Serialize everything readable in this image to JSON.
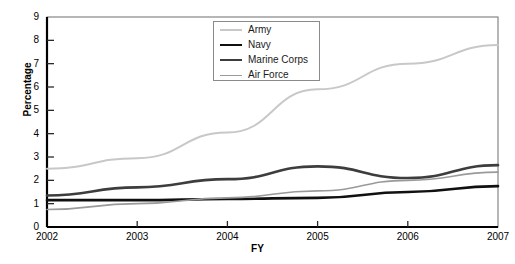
{
  "chart_data": {
    "type": "line",
    "title": "",
    "xlabel": "FY",
    "ylabel": "Percentage",
    "categories": [
      "2002",
      "2003",
      "2004",
      "2005",
      "2006",
      "2007"
    ],
    "x": [
      2002,
      2003,
      2004,
      2005,
      2006,
      2007
    ],
    "xlim": [
      2002,
      2007
    ],
    "ylim": [
      0,
      9
    ],
    "yticks": [
      0,
      1,
      2,
      3,
      4,
      5,
      6,
      7,
      8,
      9
    ],
    "ytick_labels": [
      "0",
      "1",
      "2",
      "3",
      "4",
      "5",
      "6",
      "7",
      "8",
      "9"
    ],
    "xtick_labels": [
      "2002",
      "2003",
      "2004",
      "2005",
      "2006",
      "2007"
    ],
    "grid": false,
    "legend_position": "upper-center-right",
    "series": [
      {
        "name": "Army",
        "values": [
          2.5,
          2.95,
          4.05,
          5.9,
          7.0,
          7.8
        ],
        "color": "#c8c8c8",
        "width": 2
      },
      {
        "name": "Navy",
        "values": [
          1.15,
          1.15,
          1.2,
          1.25,
          1.5,
          1.75
        ],
        "color": "#101010",
        "width": 2.6
      },
      {
        "name": "Marine Corps",
        "values": [
          1.35,
          1.7,
          2.05,
          2.6,
          2.1,
          2.65
        ],
        "color": "#3d3d3d",
        "width": 2.6
      },
      {
        "name": "Air Force",
        "values": [
          0.75,
          1.0,
          1.25,
          1.55,
          2.0,
          2.35
        ],
        "color": "#9a9a9a",
        "width": 1.6
      }
    ]
  },
  "axes": {
    "y_title": "Percentage",
    "x_title": "FY"
  },
  "legend": {
    "entries": [
      {
        "label": "Army"
      },
      {
        "label": "Navy"
      },
      {
        "label": "Marine Corps"
      },
      {
        "label": "Air Force"
      }
    ]
  },
  "style": {
    "frame_color": "#6f6f6f",
    "axis_color": "#000000",
    "background": "#ffffff"
  }
}
